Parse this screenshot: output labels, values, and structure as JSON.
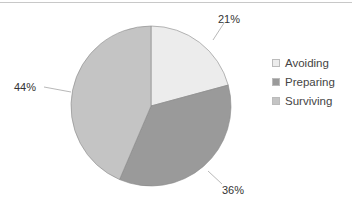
{
  "chart_data": {
    "type": "pie",
    "title": "",
    "categories": [
      "Avoiding",
      "Preparing",
      "Surviving"
    ],
    "values": [
      21,
      36,
      44
    ],
    "labels": [
      "21%",
      "36%",
      "44%"
    ],
    "colors": [
      "#ececec",
      "#9a9a9a",
      "#c4c4c4"
    ],
    "legend_position": "right",
    "start_angle": "12 o'clock, clockwise"
  },
  "legend": {
    "items": [
      {
        "label": "Avoiding",
        "color": "#ececec"
      },
      {
        "label": "Preparing",
        "color": "#9a9a9a"
      },
      {
        "label": "Surviving",
        "color": "#c4c4c4"
      }
    ]
  },
  "labels": {
    "avoiding": "21%",
    "preparing": "36%",
    "surviving": "44%"
  }
}
